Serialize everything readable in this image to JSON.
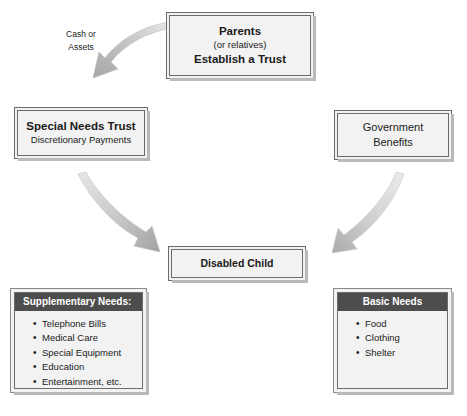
{
  "diagram": {
    "colors": {
      "box_fill": "#f2f2f2",
      "box_border": "#6b6b6b",
      "panel_header_bg": "#4d4d4d",
      "panel_header_text": "#ffffff",
      "text": "#1a1a1a",
      "arrow_light": "#e3e3e3",
      "arrow_dark": "#9a9a9a",
      "shadow": "#b9b9b9"
    },
    "boxes": {
      "parents": {
        "name": "parents-box",
        "lines": [
          {
            "text": "Parents",
            "style": "bold"
          },
          {
            "text": "(or relatives)",
            "style": "regular"
          },
          {
            "text": "Establish a Trust",
            "style": "bold"
          }
        ]
      },
      "special_needs_trust": {
        "name": "special-needs-trust-box",
        "lines": [
          {
            "text": "Special Needs Trust",
            "style": "bold"
          },
          {
            "text": "Discretionary Payments",
            "style": "regular"
          }
        ]
      },
      "government_benefits": {
        "name": "government-benefits-box",
        "lines": [
          {
            "text": "Government",
            "style": "regular-medium"
          },
          {
            "text": "Benefits",
            "style": "regular-medium"
          }
        ]
      },
      "disabled_child": {
        "name": "disabled-child-box",
        "lines": [
          {
            "text": "Disabled Child",
            "style": "bold-small"
          }
        ]
      }
    },
    "panels": {
      "supplementary": {
        "header": "Supplementary Needs:",
        "header_align": "left",
        "items": [
          "Telephone Bills",
          "Medical Care",
          "Special Equipment",
          "Education",
          "Entertainment, etc."
        ]
      },
      "basic": {
        "header": "Basic Needs",
        "header_align": "center",
        "items": [
          "Food",
          "Clothing",
          "Shelter"
        ]
      }
    },
    "labels": {
      "cash_or_assets": {
        "line1": "Cash or",
        "line2": "Assets"
      }
    },
    "arrows": [
      {
        "name": "arrow-parents-to-trust",
        "from": "parents",
        "to": "special_needs_trust",
        "direction": "down-left"
      },
      {
        "name": "arrow-trust-to-child",
        "from": "special_needs_trust",
        "to": "disabled_child",
        "direction": "down-right"
      },
      {
        "name": "arrow-benefits-to-child",
        "from": "government_benefits",
        "to": "disabled_child",
        "direction": "down-left"
      }
    ]
  }
}
